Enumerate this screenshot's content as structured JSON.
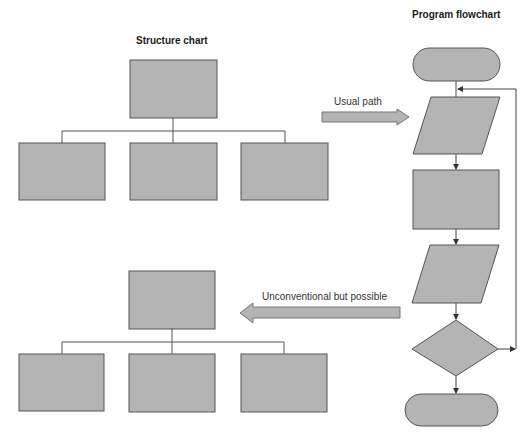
{
  "titles": {
    "structure_chart": "Structure chart",
    "program_flowchart": "Program flowchart"
  },
  "arrows": {
    "usual_path": "Usual path",
    "unconventional": "Unconventional but possible"
  },
  "colors": {
    "shape_fill": "#b4b4b4",
    "shape_stroke": "#555555",
    "line": "#555555",
    "background": "#ffffff"
  },
  "structure_chart": {
    "levels": [
      "parent module",
      "child modules x3"
    ]
  },
  "flowchart": {
    "steps": [
      "start terminal",
      "input/output",
      "process",
      "input/output",
      "decision",
      "end terminal"
    ],
    "loop": "decision loops back to first input/output"
  }
}
